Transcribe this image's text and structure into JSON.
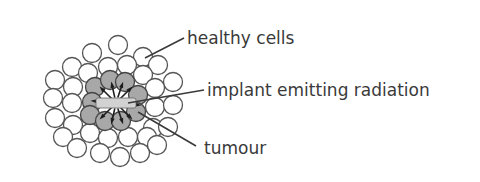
{
  "labels": {
    "healthy": "healthy cells",
    "implant": "implant emitting radiation",
    "tumour": "tumour"
  },
  "colors": {
    "healthy_fill": "#ffffff",
    "tumour_fill": "#a8a8a8",
    "outline": "#555555",
    "text": "#3a3a3a",
    "implant_fill": "#d2d2d2"
  },
  "cell_radius": 9.5,
  "healthy_cells": [
    [
      118,
      45
    ],
    [
      92,
      53
    ],
    [
      143,
      57
    ],
    [
      72,
      67
    ],
    [
      108,
      67
    ],
    [
      127,
      65
    ],
    [
      158,
      65
    ],
    [
      88,
      73
    ],
    [
      143,
      75
    ],
    [
      55,
      80
    ],
    [
      73,
      87
    ],
    [
      173,
      82
    ],
    [
      155,
      88
    ],
    [
      53,
      98
    ],
    [
      72,
      103
    ],
    [
      155,
      107
    ],
    [
      173,
      105
    ],
    [
      55,
      118
    ],
    [
      73,
      125
    ],
    [
      153,
      128
    ],
    [
      168,
      127
    ],
    [
      63,
      137
    ],
    [
      90,
      133
    ],
    [
      108,
      138
    ],
    [
      128,
      137
    ],
    [
      147,
      137
    ],
    [
      77,
      148
    ],
    [
      100,
      153
    ],
    [
      120,
      157
    ],
    [
      140,
      153
    ],
    [
      157,
      145
    ]
  ],
  "tumour_cells": [
    [
      95,
      87
    ],
    [
      110,
      80
    ],
    [
      125,
      82
    ],
    [
      138,
      95
    ],
    [
      92,
      102
    ],
    [
      90,
      115
    ],
    [
      105,
      121
    ],
    [
      121,
      121
    ],
    [
      136,
      112
    ]
  ],
  "implant": {
    "x": 96,
    "y": 98,
    "w": 40,
    "h": 10
  },
  "leaders": [
    {
      "from": [
        145,
        58
      ],
      "to": [
        184,
        38
      ]
    },
    {
      "from": [
        128,
        103
      ],
      "to": [
        204,
        90
      ]
    },
    {
      "from": [
        138,
        112
      ],
      "to": [
        196,
        146
      ]
    }
  ]
}
